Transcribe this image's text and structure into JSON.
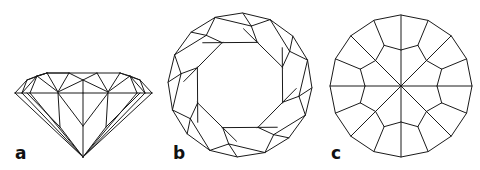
{
  "figure": {
    "panels": [
      {
        "id": "a",
        "label": "a",
        "view": "side view (profile)"
      },
      {
        "id": "b",
        "label": "b",
        "view": "top view (crown facets)"
      },
      {
        "id": "c",
        "label": "c",
        "view": "bottom view (pavilion facets)"
      }
    ],
    "colors": {
      "line": "#1a1a1a",
      "background": "#ffffff"
    }
  }
}
